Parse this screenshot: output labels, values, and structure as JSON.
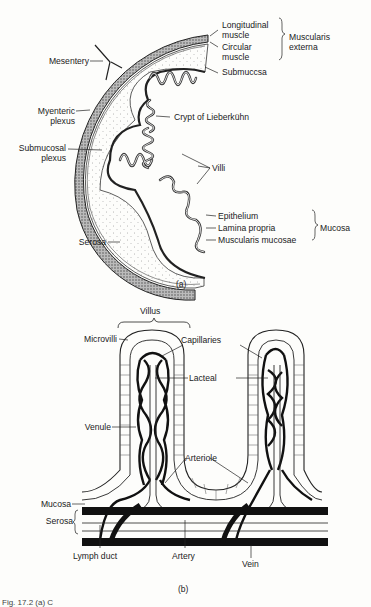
{
  "figure": {
    "panel_a": {
      "caption": "(a)",
      "labels": {
        "longitudinal_1": "Longitudinal",
        "longitudinal_2": "muscle",
        "circular_1": "Circular",
        "circular_2": "muscle",
        "muscularis_externa_1": "Muscularis",
        "muscularis_externa_2": "externa",
        "submucosa": "Submuccsa",
        "mesentery": "Mesentery",
        "myenteric_1": "Myenteric",
        "myenteric_2": "plexus",
        "crypt": "Crypt of Lieberkühn",
        "submucosal_1": "Submucosal",
        "submucosal_2": "plexus",
        "villi": "Villi",
        "epithelium": "Epithelium",
        "lamina_propria": "Lamina propria",
        "muscularis_mucosae": "Muscularis mucosae",
        "mucosa": "Mucosa",
        "serosa": "Serosa"
      }
    },
    "panel_b": {
      "caption": "(b)",
      "labels": {
        "villus": "Villus",
        "microvilli": "Microvilli",
        "capillaries": "Capillaries",
        "lacteal": "Lacteal",
        "venule": "Venule",
        "arteriole": "Arteriole",
        "mucosa": "Mucosa",
        "serosa": "Serosa",
        "lymph_duct": "Lymph duct",
        "artery": "Artery",
        "vein": "Vein"
      }
    },
    "footer_caption": "Fig. 17.2 (a) C"
  }
}
